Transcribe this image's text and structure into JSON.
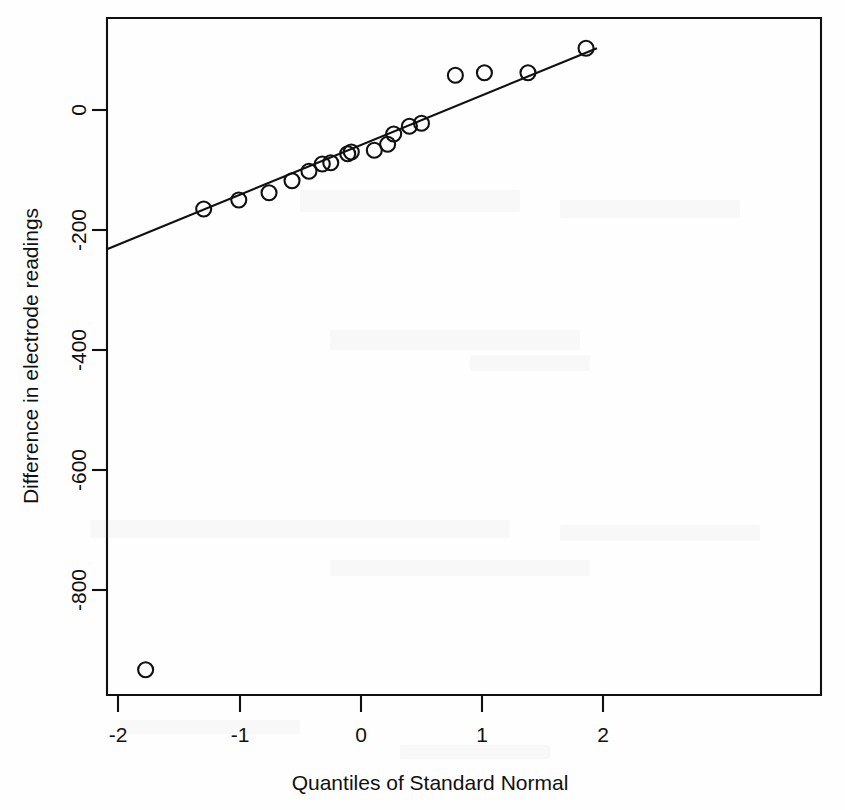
{
  "chart_data": {
    "type": "scatter",
    "title": "",
    "xlabel": "Quantiles of Standard Normal",
    "ylabel": "Difference in electrode readings",
    "xlim": [
      -2.1,
      1.95
    ],
    "ylim": [
      -980,
      135
    ],
    "grid": false,
    "legend": null,
    "xticks": [
      -2,
      -1,
      0,
      1,
      2
    ],
    "xtick_labels": [
      "-2",
      "-1",
      "0",
      "1",
      "2"
    ],
    "yticks": [
      0,
      -200,
      -400,
      -600,
      -800
    ],
    "ytick_labels": [
      "0",
      "-200",
      "-400",
      "-600",
      "-800"
    ],
    "marker": "open-circle",
    "points": [
      {
        "x": -1.78,
        "y": -933
      },
      {
        "x": -1.3,
        "y": -165
      },
      {
        "x": -1.01,
        "y": -150
      },
      {
        "x": -0.76,
        "y": -138
      },
      {
        "x": -0.57,
        "y": -118
      },
      {
        "x": -0.43,
        "y": -102
      },
      {
        "x": -0.32,
        "y": -90
      },
      {
        "x": -0.25,
        "y": -88
      },
      {
        "x": -0.11,
        "y": -73
      },
      {
        "x": -0.08,
        "y": -70
      },
      {
        "x": 0.11,
        "y": -67
      },
      {
        "x": 0.22,
        "y": -57
      },
      {
        "x": 0.27,
        "y": -40
      },
      {
        "x": 0.4,
        "y": -27
      },
      {
        "x": 0.5,
        "y": -22
      },
      {
        "x": 0.78,
        "y": 58
      },
      {
        "x": 1.02,
        "y": 62
      },
      {
        "x": 1.38,
        "y": 62
      },
      {
        "x": 1.86,
        "y": 103
      }
    ],
    "fit_line": {
      "name": "qqline",
      "x1": -2.1,
      "y1": -232,
      "x2": 1.95,
      "y2": 103
    }
  },
  "axes": {
    "x_title": "Quantiles of Standard Normal",
    "y_title": "Difference in electrode readings",
    "x_labels": [
      "-2",
      "-1",
      "0",
      "1",
      "2"
    ],
    "y_labels": [
      "0",
      "-200",
      "-400",
      "-600",
      "-800"
    ]
  },
  "colors": {
    "ink": "#101010",
    "background": "#fefefe"
  }
}
